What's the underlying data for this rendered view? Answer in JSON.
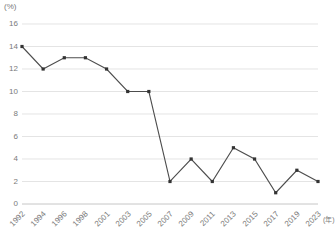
{
  "chart_data": {
    "type": "line",
    "title": "",
    "subtitle": "",
    "xlabel": "(年)",
    "ylabel": "(%)",
    "unit_label": "(%)",
    "x_axis_suffix": "(年)",
    "categories": [
      "1992",
      "1994",
      "1996",
      "1998",
      "2001",
      "2003",
      "2005",
      "2007",
      "2009",
      "2011",
      "2013",
      "2015",
      "2017",
      "2019",
      "2023"
    ],
    "values": [
      14,
      12,
      13,
      13,
      12,
      10,
      10,
      2,
      4,
      2,
      5,
      4,
      1,
      3,
      2
    ],
    "series": [
      {
        "name": "",
        "values": [
          14,
          12,
          13,
          13,
          12,
          10,
          10,
          2,
          4,
          2,
          5,
          4,
          1,
          3,
          2
        ]
      }
    ],
    "y_ticks": [
      0,
      2,
      4,
      6,
      8,
      10,
      12,
      14,
      16
    ],
    "y_tick_labels": [
      "0",
      "2",
      "4",
      "6",
      "8",
      "10",
      "12",
      "14",
      "16"
    ],
    "ylim": [
      0,
      16
    ],
    "xlim_categories": 15,
    "grid": true,
    "grid_axis": "y",
    "legend": false,
    "legend_position": "none",
    "markers": true,
    "marker_shape": "square",
    "colors": {
      "line": "#4d4d4d",
      "marker": "#333333",
      "grid": "#d9d9d9",
      "axis": "#bfbfbf",
      "text": "#7a7a7a",
      "background": "#ffffff"
    }
  }
}
